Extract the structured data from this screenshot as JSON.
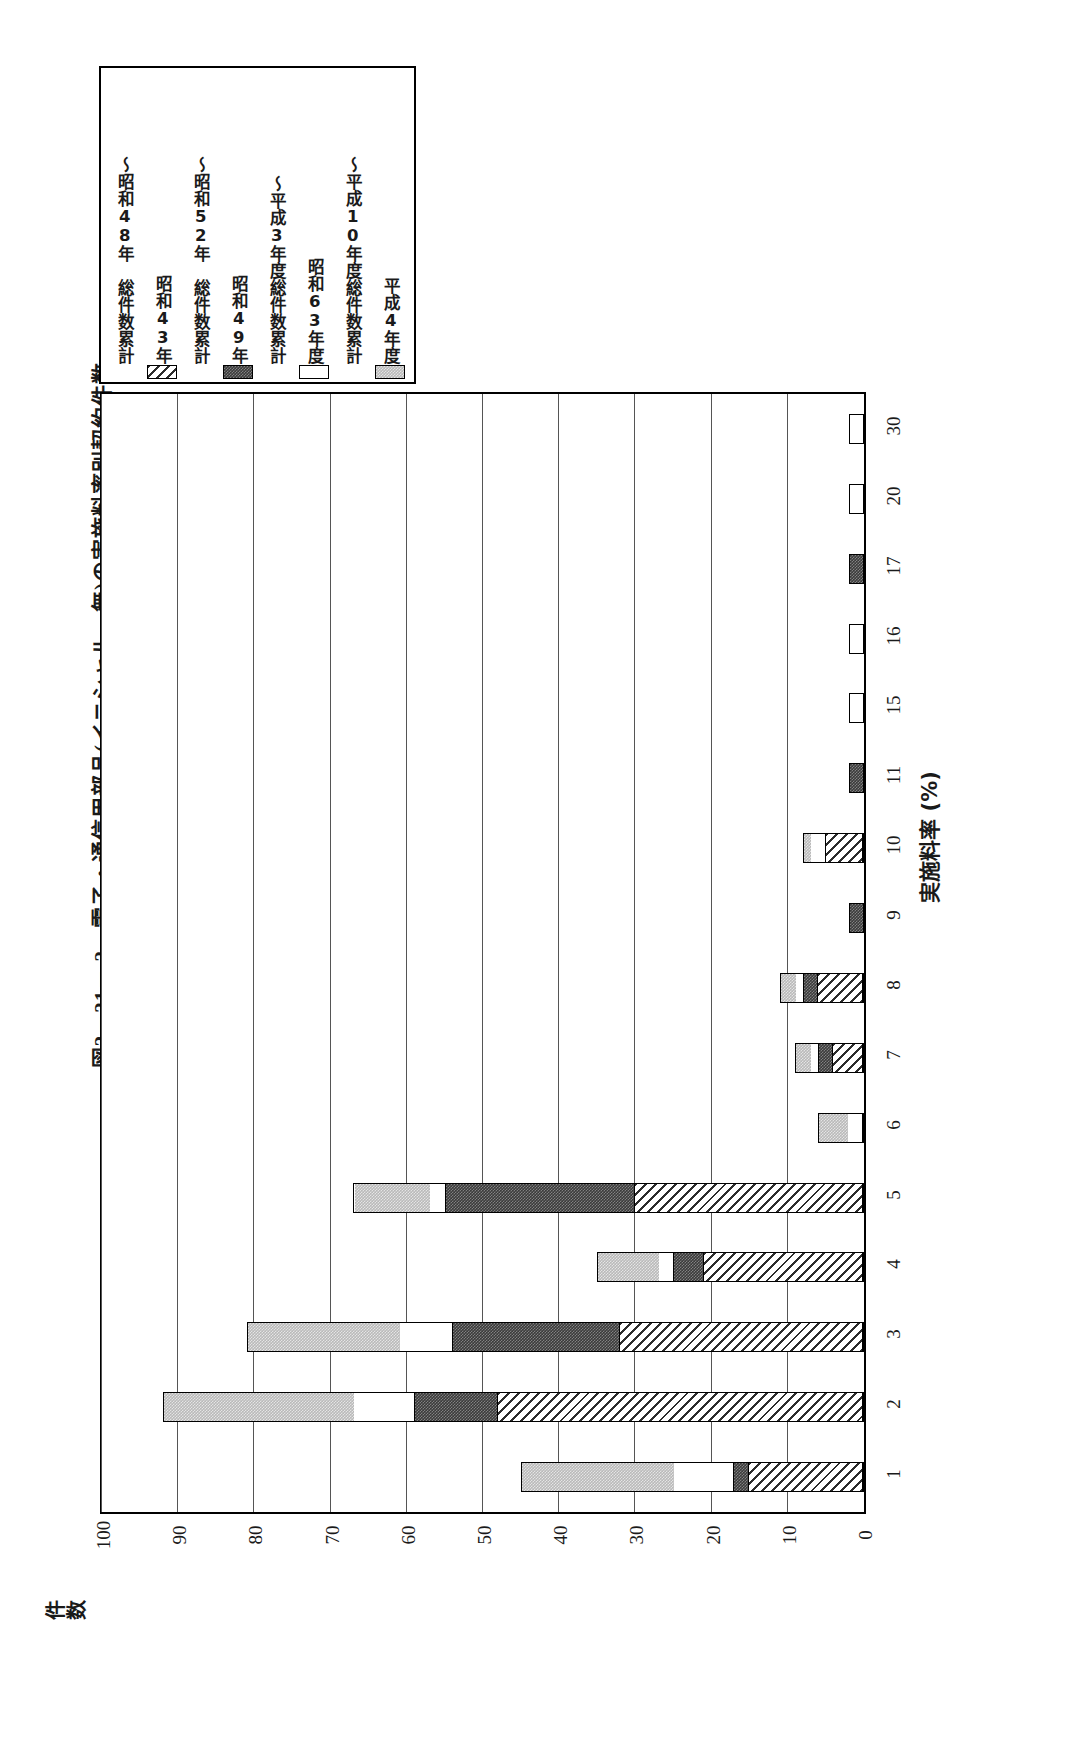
{
  "figure": {
    "title": "図2－21－ 2　電子・通信用部品(イニシャル　無)の実施料率別契約件数",
    "value_axis_label": "件数",
    "category_axis_label": "実施料率 (%)"
  },
  "legend": {
    "items": [
      {
        "label": "平成4年度",
        "pattern": "gray",
        "swatch": true
      },
      {
        "label": "～平成10年度総件数累計",
        "pattern": "none",
        "swatch": false
      },
      {
        "label": "昭和63年度",
        "pattern": "white",
        "swatch": true
      },
      {
        "label": "～平成3年度総件数累計",
        "pattern": "none",
        "swatch": false
      },
      {
        "label": "昭和49年",
        "pattern": "dark",
        "swatch": true
      },
      {
        "label": "～昭和52年　総件数累計",
        "pattern": "none",
        "swatch": false
      },
      {
        "label": "昭和43年",
        "pattern": "hatch",
        "swatch": true
      },
      {
        "label": "～昭和48年　総件数累計",
        "pattern": "none",
        "swatch": false
      }
    ]
  },
  "chart_data": {
    "type": "bar",
    "orientation": "horizontal-stacked",
    "title": "図2－21－ 2　電子・通信用部品(イニシャル　無)の実施料率別契約件数",
    "xlabel": "実施料率 (%)",
    "ylabel": "件数",
    "ylim": [
      0,
      100
    ],
    "yticks": [
      100,
      90,
      80,
      70,
      60,
      50,
      40,
      30,
      20,
      10,
      0
    ],
    "grid": true,
    "legend_position": "top-left",
    "categories": [
      "1",
      "2",
      "3",
      "4",
      "5",
      "6",
      "7",
      "8",
      "9",
      "10",
      "11",
      "15",
      "16",
      "17",
      "20",
      "30"
    ],
    "series": [
      {
        "name": "昭和43年～昭和48年　総件数累計",
        "pattern": "hatch",
        "values": [
          15,
          48,
          32,
          21,
          30,
          0,
          4,
          6,
          0,
          5,
          0,
          0,
          0,
          0,
          0,
          0
        ]
      },
      {
        "name": "昭和49年～昭和52年　総件数累計",
        "pattern": "dark",
        "values": [
          2,
          11,
          22,
          4,
          25,
          0,
          2,
          2,
          2,
          0,
          2,
          0,
          0,
          2,
          0,
          0
        ]
      },
      {
        "name": "昭和63年度～平成3年度総件数累計",
        "pattern": "white",
        "values": [
          8,
          8,
          7,
          2,
          2,
          2,
          1,
          1,
          0,
          2,
          0,
          2,
          2,
          0,
          2,
          2
        ]
      },
      {
        "name": "平成4年度～平成10年度総件数累計",
        "pattern": "gray",
        "values": [
          20,
          25,
          20,
          8,
          10,
          4,
          2,
          2,
          0,
          1,
          0,
          0,
          0,
          0,
          0,
          0
        ]
      }
    ],
    "totals": [
      45,
      92,
      81,
      35,
      67,
      6,
      9,
      11,
      2,
      8,
      2,
      2,
      2,
      2,
      2,
      2
    ]
  }
}
